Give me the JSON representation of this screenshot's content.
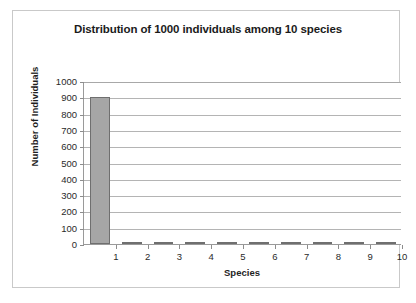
{
  "chart_data": {
    "type": "bar",
    "title": "Distribution of 1000 individuals among 10 species",
    "xlabel": "Species",
    "ylabel": "Number of Individuals",
    "categories": [
      "1",
      "2",
      "3",
      "4",
      "5",
      "6",
      "7",
      "8",
      "9",
      "10"
    ],
    "values": [
      900,
      12,
      11,
      11,
      11,
      11,
      11,
      11,
      11,
      11
    ],
    "series": [
      {
        "name": "Number of Individuals",
        "values": [
          900,
          12,
          11,
          11,
          11,
          11,
          11,
          11,
          11,
          11
        ]
      }
    ],
    "ylim": [
      0,
      1000
    ],
    "ytick_values": [
      0,
      100,
      200,
      300,
      400,
      500,
      600,
      700,
      800,
      900,
      1000
    ],
    "ytick_labels": [
      "0",
      "100",
      "200",
      "300",
      "400",
      "500",
      "600",
      "700",
      "800",
      "900",
      "1000"
    ],
    "xtick_labels": [
      "1",
      "2",
      "3",
      "4",
      "5",
      "6",
      "7",
      "8",
      "9",
      "10"
    ],
    "grid": "horizontal",
    "legend": "none",
    "bar_fill_color": "#a6a6a6",
    "bar_border_color": "#6f6f6f",
    "gridline_color": "#b4b4b4",
    "axis_color": "#9a9a9a",
    "plot_background": "#ffffff",
    "frame_border_color": "#c9c9c9"
  }
}
